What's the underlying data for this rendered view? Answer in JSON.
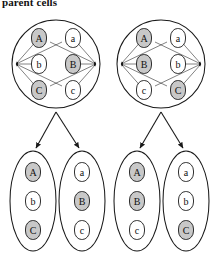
{
  "figure": {
    "caption": "parent cells",
    "colors": {
      "shaded_chromosome": "#c8c8c8",
      "unshaded_chromosome": "#ffffff",
      "outline": "#1a1a1a",
      "background": "#ffffff"
    }
  },
  "parent_cells": [
    {
      "id": "parent-cell-left",
      "shape": "circle",
      "cx": 56,
      "cy": 64,
      "r": 44,
      "spindle_poles": [
        "left",
        "right"
      ],
      "chromosomes": [
        {
          "label": "A",
          "shaded": true,
          "side": "left",
          "row": 1
        },
        {
          "label": "a",
          "shaded": false,
          "side": "right",
          "row": 1
        },
        {
          "label": "b",
          "shaded": false,
          "side": "left",
          "row": 2
        },
        {
          "label": "B",
          "shaded": true,
          "side": "right",
          "row": 2
        },
        {
          "label": "C",
          "shaded": true,
          "side": "left",
          "row": 3
        },
        {
          "label": "c",
          "shaded": false,
          "side": "right",
          "row": 3
        }
      ]
    },
    {
      "id": "parent-cell-right",
      "shape": "circle",
      "cx": 161,
      "cy": 64,
      "r": 44,
      "spindle_poles": [
        "left",
        "right"
      ],
      "chromosomes": [
        {
          "label": "A",
          "shaded": true,
          "side": "left",
          "row": 1
        },
        {
          "label": "a",
          "shaded": false,
          "side": "right",
          "row": 1
        },
        {
          "label": "B",
          "shaded": true,
          "side": "left",
          "row": 2
        },
        {
          "label": "b",
          "shaded": false,
          "side": "right",
          "row": 2
        },
        {
          "label": "c",
          "shaded": false,
          "side": "left",
          "row": 3
        },
        {
          "label": "C",
          "shaded": true,
          "side": "right",
          "row": 3
        }
      ]
    }
  ],
  "daughter_cells": [
    {
      "id": "daughter-cell-1",
      "parent": "parent-cell-left",
      "shape": "ellipse",
      "cx": 33,
      "cy": 201,
      "rx": 23,
      "ry": 50,
      "chromosomes": [
        {
          "label": "A",
          "shaded": true
        },
        {
          "label": "b",
          "shaded": false
        },
        {
          "label": "C",
          "shaded": true
        }
      ]
    },
    {
      "id": "daughter-cell-2",
      "parent": "parent-cell-left",
      "shape": "ellipse",
      "cx": 82,
      "cy": 201,
      "rx": 23,
      "ry": 50,
      "chromosomes": [
        {
          "label": "a",
          "shaded": false
        },
        {
          "label": "B",
          "shaded": true
        },
        {
          "label": "c",
          "shaded": false
        }
      ]
    },
    {
      "id": "daughter-cell-3",
      "parent": "parent-cell-right",
      "shape": "ellipse",
      "cx": 137,
      "cy": 201,
      "rx": 23,
      "ry": 50,
      "chromosomes": [
        {
          "label": "A",
          "shaded": true
        },
        {
          "label": "B",
          "shaded": true
        },
        {
          "label": "c",
          "shaded": false
        }
      ]
    },
    {
      "id": "daughter-cell-4",
      "parent": "parent-cell-right",
      "shape": "ellipse",
      "cx": 186,
      "cy": 201,
      "rx": 23,
      "ry": 50,
      "chromosomes": [
        {
          "label": "a",
          "shaded": false
        },
        {
          "label": "b",
          "shaded": false
        },
        {
          "label": "C",
          "shaded": true
        }
      ]
    }
  ],
  "division_arrows": [
    {
      "from": "parent-cell-left",
      "to": "daughter-cell-1",
      "x1": 56,
      "y1": 112,
      "x2": 36,
      "y2": 148
    },
    {
      "from": "parent-cell-left",
      "to": "daughter-cell-2",
      "x1": 56,
      "y1": 112,
      "x2": 79,
      "y2": 148
    },
    {
      "from": "parent-cell-right",
      "to": "daughter-cell-3",
      "x1": 161,
      "y1": 112,
      "x2": 140,
      "y2": 148
    },
    {
      "from": "parent-cell-right",
      "to": "daughter-cell-4",
      "x1": 161,
      "y1": 112,
      "x2": 183,
      "y2": 148
    }
  ]
}
